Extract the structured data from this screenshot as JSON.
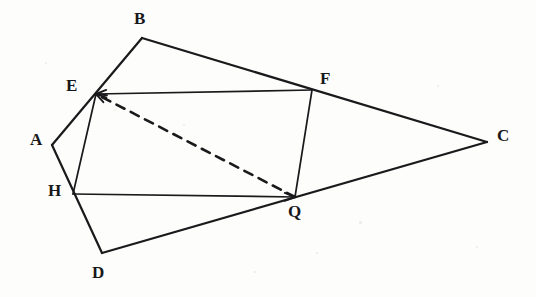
{
  "figure": {
    "background_color": "#fdfdfc",
    "stroke_color": "#1a1a1c",
    "label_color": "#18181a",
    "outer_stroke_width": 2.2,
    "inner_stroke_width": 1.7,
    "dashed_stroke_width": 2.6,
    "dash_pattern": "9,7",
    "points": {
      "A": {
        "label": "A",
        "x": 52,
        "y": 145,
        "label_x": 30,
        "label_y": 131
      },
      "B": {
        "label": "B",
        "x": 142,
        "y": 38,
        "label_x": 134,
        "label_y": 10
      },
      "C": {
        "label": "C",
        "x": 487,
        "y": 142,
        "label_x": 497,
        "label_y": 127
      },
      "D": {
        "label": "D",
        "x": 102,
        "y": 253,
        "label_x": 92,
        "label_y": 264
      },
      "E": {
        "label": "E",
        "x": 96,
        "y": 94,
        "label_x": 66,
        "label_y": 77
      },
      "F": {
        "label": "F",
        "x": 312,
        "y": 90,
        "label_x": 320,
        "label_y": 70
      },
      "H": {
        "label": "H",
        "x": 73,
        "y": 194,
        "label_x": 48,
        "label_y": 182
      },
      "Q": {
        "label": "Q",
        "x": 295,
        "y": 197,
        "label_x": 288,
        "label_y": 203
      }
    },
    "outer_edges": [
      {
        "name": "edge-A-B",
        "from": "A",
        "to": "B"
      },
      {
        "name": "edge-B-C",
        "from": "B",
        "to": "C"
      },
      {
        "name": "edge-C-D",
        "from": "C",
        "to": "D"
      },
      {
        "name": "edge-D-A",
        "from": "D",
        "to": "A"
      }
    ],
    "inner_edges": [
      {
        "name": "segment-F-E",
        "from": "F",
        "to": "E",
        "arrow_at_end": true
      },
      {
        "name": "segment-F-Q",
        "from": "F",
        "to": "Q",
        "arrow_at_end": false
      },
      {
        "name": "segment-H-Q",
        "from": "H",
        "to": "Q",
        "arrow_at_end": true
      },
      {
        "name": "segment-E-H",
        "from": "E",
        "to": "H",
        "arrow_at_end": false
      }
    ],
    "dashed_edges": [
      {
        "name": "diagonal-Q-E",
        "from": "Q",
        "to": "E",
        "arrow_at_end": true
      }
    ],
    "arrowheads": [
      {
        "name": "arrowhead-at-E-from-F",
        "at": "E",
        "from": "F"
      },
      {
        "name": "arrowhead-at-E-from-Q",
        "at": "E",
        "from": "Q"
      },
      {
        "name": "arrowhead-at-Q-from-H",
        "at": "Q",
        "from": "H"
      }
    ],
    "specks": [
      {
        "x": 359,
        "y": 221,
        "size": 3
      },
      {
        "x": 183,
        "y": 124,
        "size": 2
      },
      {
        "x": 114,
        "y": 109,
        "size": 2
      },
      {
        "x": 437,
        "y": 85,
        "size": 2
      },
      {
        "x": 254,
        "y": 271,
        "size": 2
      },
      {
        "x": 45,
        "y": 62,
        "size": 2
      },
      {
        "x": 476,
        "y": 246,
        "size": 2
      },
      {
        "x": 316,
        "y": 252,
        "size": 2
      }
    ]
  }
}
